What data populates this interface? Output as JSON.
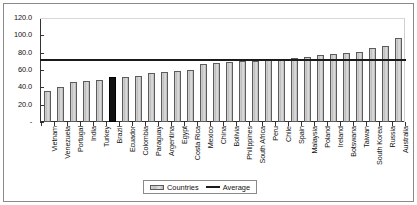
{
  "chart_data": {
    "type": "bar",
    "title": "",
    "xlabel": "",
    "ylabel": "",
    "ylim": [
      0,
      120
    ],
    "ytick_labels": [
      "120.0",
      "100.0",
      "80.0",
      "60.0",
      "40.0",
      "20.0",
      "-"
    ],
    "ytick_values": [
      120,
      100,
      80,
      60,
      40,
      20,
      0
    ],
    "grid": false,
    "legend_position": "bottom-center",
    "categories": [
      "Vietnam",
      "Venezuela",
      "Portugal",
      "India",
      "Turkey",
      "Brazil",
      "Ecuador",
      "Colombia",
      "Paraguay",
      "Argentina",
      "Egypt",
      "Costa Rica",
      "Mexico",
      "China",
      "Bolivia",
      "Philippines",
      "South Africa",
      "Peru",
      "Chile",
      "Spain",
      "Malaysia",
      "Poland",
      "Ireland",
      "Botswana",
      "Taiwan",
      "South Korea",
      "Russia",
      "Australia"
    ],
    "series": [
      {
        "name": "Countries",
        "values": [
          36,
          40,
          46,
          47,
          48,
          52,
          52,
          53,
          57,
          58,
          59,
          60,
          67,
          68,
          69,
          70,
          70,
          72,
          73,
          74,
          75,
          77,
          78,
          80,
          81,
          85,
          88,
          97
        ],
        "highlight_category": "Brazil",
        "highlight_color": "#111111",
        "bar_color": "#c6c6c6"
      },
      {
        "name": "Average",
        "type": "line",
        "value": 71,
        "color": "#1a1a1a"
      }
    ],
    "legend": [
      {
        "label": "Countries",
        "swatch": "bar-swatch"
      },
      {
        "label": "Average",
        "swatch": "line-swatch"
      }
    ]
  }
}
